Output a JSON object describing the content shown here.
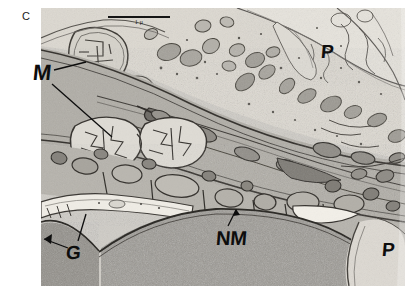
{
  "figure": {
    "panel_letter": "C",
    "scale_bar": {
      "label": "1 μ",
      "length_px": 62
    },
    "annotations": [
      {
        "key": "M",
        "label": "M",
        "meaning": "mitochondrion"
      },
      {
        "key": "G",
        "label": "G",
        "meaning": "golgi"
      },
      {
        "key": "NM",
        "label": "NM",
        "meaning": "nuclear-membrane"
      },
      {
        "key": "P1",
        "label": "P",
        "meaning": "process"
      },
      {
        "key": "P2",
        "label": "P",
        "meaning": "process"
      }
    ],
    "colors": {
      "background": "#ffffff",
      "label_ink": "#0d0d0d",
      "plate_mid": "#b9b7b2",
      "plate_light": "#dedbd4",
      "plate_dark": "#6f6c67",
      "nucleus": "#8a8781",
      "membrane": "#3a3733"
    }
  }
}
